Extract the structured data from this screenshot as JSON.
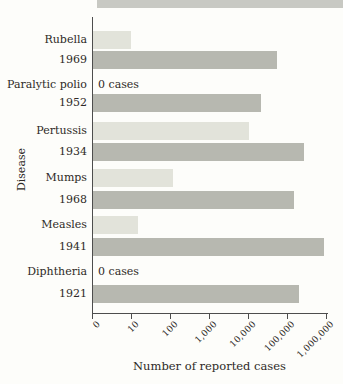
{
  "figure": {
    "zero_cases_text": "0 cases"
  },
  "colors": {
    "recent_bar": "#e2e3da",
    "peak_bar": "#b7b8b0",
    "axis": "#4d4d4d",
    "text": "#2e2a26",
    "top_strip": "#c8c9c3"
  },
  "chart_data": {
    "type": "bar",
    "orientation": "horizontal",
    "x_scale": "log",
    "title": "",
    "xlabel": "Number of reported cases",
    "ylabel": "Disease",
    "x_tick_labels": [
      "0",
      "10",
      "100",
      "1,000",
      "10,000",
      "100,000",
      "1,000,000"
    ],
    "x_range_cases": [
      0,
      1000000
    ],
    "grid": false,
    "legend": "none",
    "rows": [
      {
        "disease": "Rubella",
        "recent_cases": 10,
        "recent_label": null,
        "peak_year": "1969",
        "peak_year_cases": 57000
      },
      {
        "disease": "Paralytic polio",
        "recent_cases": 0,
        "recent_label": "0 cases",
        "peak_year": "1952",
        "peak_year_cases": 21000
      },
      {
        "disease": "Pertussis",
        "recent_cases": 10500,
        "recent_label": null,
        "peak_year": "1934",
        "peak_year_cases": 265000
      },
      {
        "disease": "Mumps",
        "recent_cases": 120,
        "recent_label": null,
        "peak_year": "1968",
        "peak_year_cases": 150000
      },
      {
        "disease": "Measles",
        "recent_cases": 15,
        "recent_label": null,
        "peak_year": "1941",
        "peak_year_cases": 900000
      },
      {
        "disease": "Diphtheria",
        "recent_cases": 0,
        "recent_label": "0 cases",
        "peak_year": "1921",
        "peak_year_cases": 200000
      }
    ]
  }
}
